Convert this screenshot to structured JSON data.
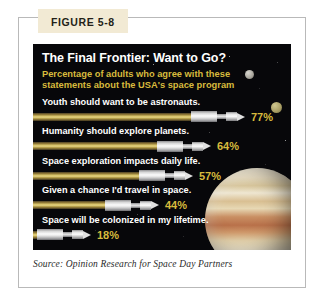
{
  "figure": {
    "tab_label": "FIGURE 5-8"
  },
  "panel": {
    "headline": "The Final Frontier: Want to Go?",
    "subhead": "Percentage of adults who agree with these statements about the USA's space program"
  },
  "source": {
    "text": "Source: Opinion Research for Space Day Partners"
  },
  "colors": {
    "panel_background": "#07070a",
    "accent_gold": "#d8bb3d",
    "bar_gold": "#d9c469",
    "rocket_white": "#fbfbfb",
    "label_white": "#ffffff",
    "tab_background": "#f2ead4",
    "frame_border": "#b9b9b9"
  },
  "chart_data": {
    "type": "bar",
    "title": "The Final Frontier: Want to Go?",
    "subtitle": "Percentage of adults who agree with these statements about the USA's space program",
    "xlabel": "",
    "ylabel": "",
    "xlim": [
      0,
      100
    ],
    "grid": false,
    "legend": "none",
    "orientation": "horizontal",
    "value_unit": "%",
    "source": "Opinion Research for Space Day Partners",
    "categories": [
      "Youth should want to be astronauts.",
      "Humanity should explore planets.",
      "Space exploration impacts daily life.",
      "Given a chance I'd travel in space.",
      "Space will be colonized in my lifetime."
    ],
    "values": [
      77,
      64,
      57,
      44,
      18
    ],
    "value_labels": [
      "77%",
      "64%",
      "57%",
      "44%",
      "18%"
    ]
  },
  "rows": [
    {
      "label": "Youth should want to be astronauts.",
      "value": 77,
      "value_label": "77%",
      "tube_px": 158
    },
    {
      "label": "Humanity should explore planets.",
      "value": 64,
      "value_label": "64%",
      "tube_px": 124
    },
    {
      "label": "Space exploration impacts daily life.",
      "value": 57,
      "value_label": "57%",
      "tube_px": 106
    },
    {
      "label": "Given a chance I'd travel in space.",
      "value": 44,
      "value_label": "44%",
      "tube_px": 72
    },
    {
      "label": "Space will be colonized in my lifetime.",
      "value": 18,
      "value_label": "18%",
      "tube_px": 4
    }
  ]
}
